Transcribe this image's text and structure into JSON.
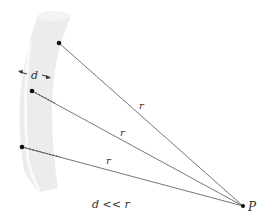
{
  "diagram": {
    "labels": {
      "thickness": "d",
      "distance_top": "r",
      "distance_middle": "r",
      "distance_bottom": "r",
      "point": "P",
      "condition": "d << r"
    },
    "colors": {
      "wire_fill": "#ececec",
      "wire_highlight": "#f8f8f8",
      "line": "#555555",
      "dot": "#111111",
      "text": "#333333"
    },
    "points": {
      "source_top": [
        59,
        43
      ],
      "source_middle": [
        32,
        91
      ],
      "source_bottom": [
        22,
        147
      ],
      "P": [
        243,
        206
      ]
    }
  }
}
